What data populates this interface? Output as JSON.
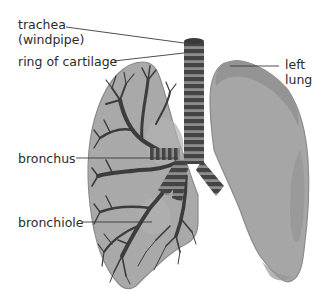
{
  "diagram": {
    "type": "labeled anatomical illustration",
    "colors": {
      "background": "#ffffff",
      "lung_fill": "#a7a7a7",
      "lung_outline": "#8c8c8c",
      "lung_shade": "#939393",
      "airway_dark": "#3e3e3e",
      "cartilage_ring": "#8a8a8a",
      "leader_line": "#3a3a3a",
      "label_text": "#2b2b2b"
    },
    "labels": {
      "trachea": {
        "line1": "trachea",
        "line2": "(windpipe)"
      },
      "ring_of_cartilage": "ring of cartilage",
      "left_lung": {
        "line1": "left",
        "line2": "lung"
      },
      "bronchus": "bronchus",
      "bronchiole": "bronchiole"
    }
  }
}
